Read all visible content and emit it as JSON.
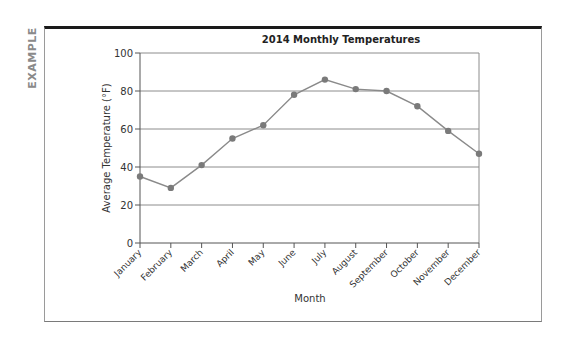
{
  "side_label": "EXAMPLE",
  "chart_data": {
    "type": "line",
    "title": "2014 Monthly Temperatures",
    "xlabel": "Month",
    "ylabel": "Average Temperature (°F)",
    "categories": [
      "January",
      "February",
      "March",
      "April",
      "May",
      "June",
      "July",
      "August",
      "September",
      "October",
      "November",
      "December"
    ],
    "series": [
      {
        "name": "Average Temperature",
        "values": [
          35,
          29,
          41,
          55,
          62,
          78,
          86,
          81,
          80,
          72,
          59,
          47
        ]
      }
    ],
    "ylim": [
      0,
      100
    ],
    "yticks": [
      0,
      20,
      40,
      60,
      80,
      100
    ],
    "grid": true,
    "legend": "none",
    "colors": {
      "line": "#8a8a8a",
      "marker": "#7a7a7a",
      "grid": "#8c8c8c",
      "axis": "#555555"
    }
  }
}
